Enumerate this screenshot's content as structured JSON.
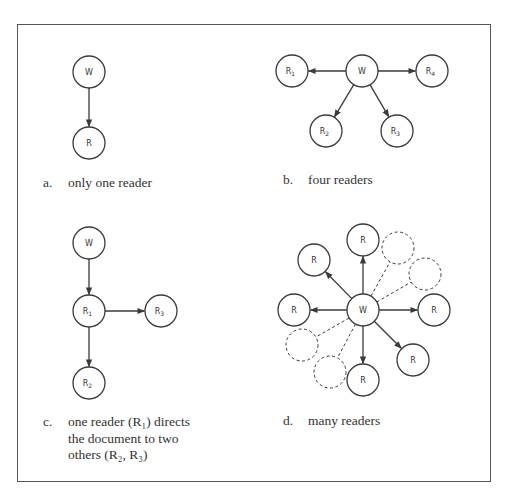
{
  "figure": {
    "panels": [
      {
        "id": "a",
        "letter": "a.",
        "caption_lines": [
          "only one reader"
        ],
        "nodes": [
          {
            "id": "W",
            "label": "W",
            "sub": "",
            "x": 89,
            "y": 72,
            "style": "solid"
          },
          {
            "id": "R",
            "label": "R",
            "sub": "",
            "x": 89,
            "y": 143,
            "style": "solid"
          }
        ],
        "edges": [
          {
            "from": "W",
            "to": "R",
            "style": "solid",
            "arrow": true
          }
        ]
      },
      {
        "id": "b",
        "letter": "b.",
        "caption_lines": [
          "four readers"
        ],
        "nodes": [
          {
            "id": "W",
            "label": "W",
            "sub": "",
            "x": 362,
            "y": 71,
            "style": "solid"
          },
          {
            "id": "R1",
            "label": "R",
            "sub": "1",
            "x": 292,
            "y": 71,
            "style": "solid"
          },
          {
            "id": "R4",
            "label": "R",
            "sub": "4",
            "x": 432,
            "y": 71,
            "style": "solid"
          },
          {
            "id": "R2",
            "label": "R",
            "sub": "2",
            "x": 326,
            "y": 131,
            "style": "solid"
          },
          {
            "id": "R3",
            "label": "R",
            "sub": "3",
            "x": 397,
            "y": 131,
            "style": "solid"
          }
        ],
        "edges": [
          {
            "from": "W",
            "to": "R1",
            "style": "solid",
            "arrow": true
          },
          {
            "from": "W",
            "to": "R4",
            "style": "solid",
            "arrow": true
          },
          {
            "from": "W",
            "to": "R2",
            "style": "solid",
            "arrow": true
          },
          {
            "from": "W",
            "to": "R3",
            "style": "solid",
            "arrow": true
          }
        ]
      },
      {
        "id": "c",
        "letter": "c.",
        "caption_lines": [
          "one reader (R₁) directs",
          "the document to two",
          "others (R₂, R₃)"
        ],
        "nodes": [
          {
            "id": "W",
            "label": "W",
            "sub": "",
            "x": 89,
            "y": 243,
            "style": "solid"
          },
          {
            "id": "R1",
            "label": "R",
            "sub": "1",
            "x": 89,
            "y": 311,
            "style": "solid"
          },
          {
            "id": "R3",
            "label": "R",
            "sub": "3",
            "x": 161,
            "y": 311,
            "style": "solid"
          },
          {
            "id": "R2",
            "label": "R",
            "sub": "2",
            "x": 89,
            "y": 383,
            "style": "solid"
          }
        ],
        "edges": [
          {
            "from": "W",
            "to": "R1",
            "style": "solid",
            "arrow": true
          },
          {
            "from": "R1",
            "to": "R3",
            "style": "solid",
            "arrow": true
          },
          {
            "from": "R1",
            "to": "R2",
            "style": "solid",
            "arrow": true
          }
        ]
      },
      {
        "id": "d",
        "letter": "d.",
        "caption_lines": [
          "many readers"
        ],
        "nodes": [
          {
            "id": "W",
            "label": "W",
            "sub": "",
            "x": 363,
            "y": 310,
            "style": "solid"
          },
          {
            "id": "Rn",
            "label": "R",
            "sub": "",
            "x": 363,
            "y": 240,
            "style": "solid"
          },
          {
            "id": "Rnw",
            "label": "R",
            "sub": "",
            "x": 314,
            "y": 260,
            "style": "solid"
          },
          {
            "id": "Rw",
            "label": "R",
            "sub": "",
            "x": 294,
            "y": 310,
            "style": "solid"
          },
          {
            "id": "Re",
            "label": "R",
            "sub": "",
            "x": 434,
            "y": 310,
            "style": "solid"
          },
          {
            "id": "Rse",
            "label": "R",
            "sub": "",
            "x": 413,
            "y": 360,
            "style": "solid"
          },
          {
            "id": "Rs",
            "label": "R",
            "sub": "",
            "x": 363,
            "y": 380,
            "style": "solid"
          },
          {
            "id": "D1",
            "label": "",
            "sub": "",
            "x": 398,
            "y": 248,
            "style": "dashed"
          },
          {
            "id": "D2",
            "label": "",
            "sub": "",
            "x": 425,
            "y": 274,
            "style": "dashed"
          },
          {
            "id": "D3",
            "label": "",
            "sub": "",
            "x": 302,
            "y": 345,
            "style": "dashed"
          },
          {
            "id": "D4",
            "label": "",
            "sub": "",
            "x": 330,
            "y": 372,
            "style": "dashed"
          }
        ],
        "edges": [
          {
            "from": "W",
            "to": "Rn",
            "style": "solid",
            "arrow": true
          },
          {
            "from": "W",
            "to": "Rnw",
            "style": "solid",
            "arrow": true
          },
          {
            "from": "W",
            "to": "Rw",
            "style": "solid",
            "arrow": true
          },
          {
            "from": "W",
            "to": "Re",
            "style": "solid",
            "arrow": true
          },
          {
            "from": "W",
            "to": "Rse",
            "style": "solid",
            "arrow": true
          },
          {
            "from": "W",
            "to": "Rs",
            "style": "solid",
            "arrow": true
          },
          {
            "from": "W",
            "to": "D1",
            "style": "dashed",
            "arrow": false
          },
          {
            "from": "W",
            "to": "D2",
            "style": "dashed",
            "arrow": false
          },
          {
            "from": "W",
            "to": "D3",
            "style": "dashed",
            "arrow": false
          },
          {
            "from": "W",
            "to": "D4",
            "style": "dashed",
            "arrow": false
          }
        ]
      }
    ],
    "node_radius": 16,
    "colors": {
      "stroke": "#3a3a3a",
      "text": "#333333",
      "frame": "#555555",
      "background": "#ffffff"
    }
  }
}
